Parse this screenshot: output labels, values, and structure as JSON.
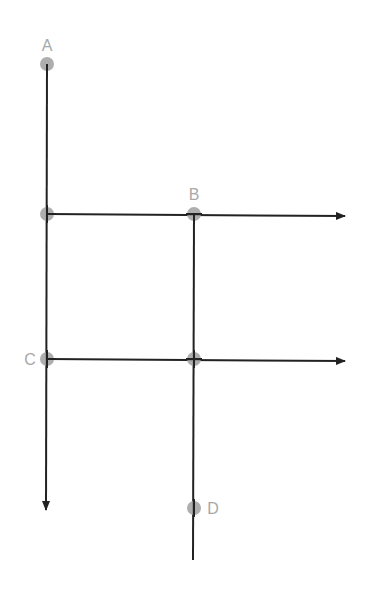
{
  "diagram": {
    "type": "graph",
    "line_color": "#222222",
    "node_color": "#a0a0a0",
    "label_color": "#a8a8a8",
    "nodes": [
      {
        "id": "A",
        "label": "A",
        "x": 47,
        "y": 64
      },
      {
        "id": "J1",
        "label": "",
        "x": 47,
        "y": 214
      },
      {
        "id": "B",
        "label": "B",
        "x": 194,
        "y": 214
      },
      {
        "id": "C",
        "label": "C",
        "x": 47,
        "y": 359
      },
      {
        "id": "J2",
        "label": "",
        "x": 194,
        "y": 359
      },
      {
        "id": "D",
        "label": "D",
        "x": 194,
        "y": 508
      }
    ],
    "edges": [
      {
        "from": "A",
        "direction": "down",
        "arrow": true,
        "end": [
          46,
          510
        ]
      },
      {
        "from": "J1",
        "direction": "right",
        "arrow": true,
        "end": [
          345,
          216
        ]
      },
      {
        "from": "C",
        "direction": "right",
        "arrow": true,
        "end": [
          345,
          361
        ]
      },
      {
        "from": "B",
        "direction": "down",
        "arrow": false,
        "end": [
          193,
          560
        ]
      }
    ],
    "labels": {
      "a": "A",
      "b": "B",
      "c": "C",
      "d": "D"
    }
  }
}
